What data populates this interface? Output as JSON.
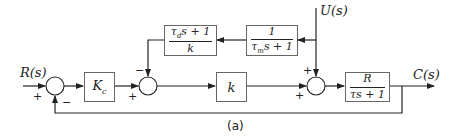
{
  "diagram": {
    "type": "block-diagram",
    "caption": "(a)",
    "signals": {
      "input": "R(s)",
      "disturbance": "U(s)",
      "output": "C(s)"
    },
    "blocks": {
      "controller": {
        "label": "K",
        "subscript": "c"
      },
      "gain": {
        "label": "k"
      },
      "derivative": {
        "numerator": "τds + 1",
        "num_main": "τ",
        "num_sub": "d",
        "num_rest": "s + 1",
        "denominator": "k"
      },
      "measurement": {
        "numerator": "1",
        "denominator": "τms + 1",
        "den_main": "τ",
        "den_sub": "m",
        "den_rest": "s + 1"
      },
      "plant": {
        "numerator": "R",
        "denominator": "τs + 1"
      }
    },
    "summing_junctions": {
      "sum1": {
        "signs": [
          "+",
          "−"
        ]
      },
      "sum2": {
        "signs": [
          "−",
          "+"
        ]
      },
      "sum3": {
        "signs": [
          "+",
          "+"
        ]
      }
    }
  }
}
